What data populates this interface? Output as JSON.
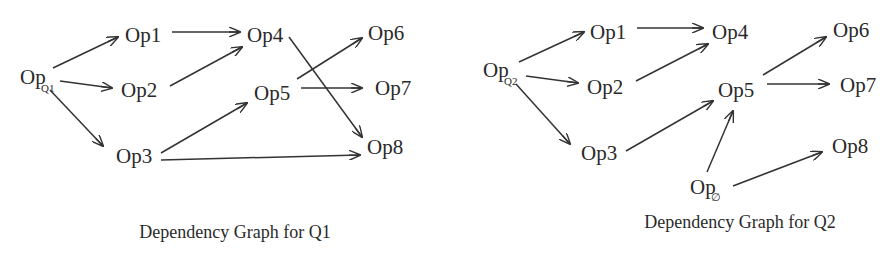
{
  "graphs": [
    {
      "title": "Dependency Graph for Q1",
      "root": {
        "label": "Op",
        "subscript": "Q1"
      },
      "nodes": [
        {
          "id": "OpQ1",
          "label": "Op",
          "subscript": "Q1",
          "x": 20,
          "y": 84
        },
        {
          "id": "Op1",
          "label": "Op1",
          "x": 125,
          "y": 42
        },
        {
          "id": "Op2",
          "label": "Op2",
          "x": 121,
          "y": 97
        },
        {
          "id": "Op3",
          "label": "Op3",
          "x": 116,
          "y": 163
        },
        {
          "id": "Op4",
          "label": "Op4",
          "x": 247,
          "y": 42
        },
        {
          "id": "Op5",
          "label": "Op5",
          "x": 254,
          "y": 100
        },
        {
          "id": "Op6",
          "label": "Op6",
          "x": 368,
          "y": 40
        },
        {
          "id": "Op7",
          "label": "Op7",
          "x": 375,
          "y": 95
        },
        {
          "id": "Op8",
          "label": "Op8",
          "x": 367,
          "y": 154
        }
      ],
      "edges": [
        [
          "OpQ1",
          "Op1"
        ],
        [
          "OpQ1",
          "Op2"
        ],
        [
          "OpQ1",
          "Op3"
        ],
        [
          "Op1",
          "Op4"
        ],
        [
          "Op2",
          "Op4"
        ],
        [
          "Op3",
          "Op5"
        ],
        [
          "Op3",
          "Op8"
        ],
        [
          "Op4",
          "Op8"
        ],
        [
          "Op5",
          "Op6"
        ],
        [
          "Op5",
          "Op7"
        ]
      ]
    },
    {
      "title": "Dependency Graph for Q2",
      "root": {
        "label": "Op",
        "subscript": "Q2"
      },
      "extra_root": {
        "label": "Op",
        "subscript": "∅"
      },
      "nodes": [
        {
          "id": "OpQ2",
          "label": "Op",
          "subscript": "Q2",
          "x": 483,
          "y": 77
        },
        {
          "id": "Op1",
          "label": "Op1",
          "x": 590,
          "y": 39
        },
        {
          "id": "Op2",
          "label": "Op2",
          "x": 587,
          "y": 94
        },
        {
          "id": "Op3",
          "label": "Op3",
          "x": 581,
          "y": 160
        },
        {
          "id": "Op4",
          "label": "Op4",
          "x": 712,
          "y": 39
        },
        {
          "id": "Op5",
          "label": "Op5",
          "x": 718,
          "y": 97
        },
        {
          "id": "Op6",
          "label": "Op6",
          "x": 833,
          "y": 37
        },
        {
          "id": "Op7",
          "label": "Op7",
          "x": 840,
          "y": 92
        },
        {
          "id": "Op8",
          "label": "Op8",
          "x": 832,
          "y": 153
        },
        {
          "id": "OpNull",
          "label": "Op",
          "subscript": "∅",
          "x": 690,
          "y": 194
        }
      ],
      "edges": [
        [
          "OpQ2",
          "Op1"
        ],
        [
          "OpQ2",
          "Op2"
        ],
        [
          "OpQ2",
          "Op3"
        ],
        [
          "Op1",
          "Op4"
        ],
        [
          "Op2",
          "Op4"
        ],
        [
          "Op3",
          "Op5"
        ],
        [
          "Op5",
          "Op6"
        ],
        [
          "Op5",
          "Op7"
        ],
        [
          "OpNull",
          "Op5"
        ],
        [
          "OpNull",
          "Op8"
        ]
      ]
    }
  ]
}
